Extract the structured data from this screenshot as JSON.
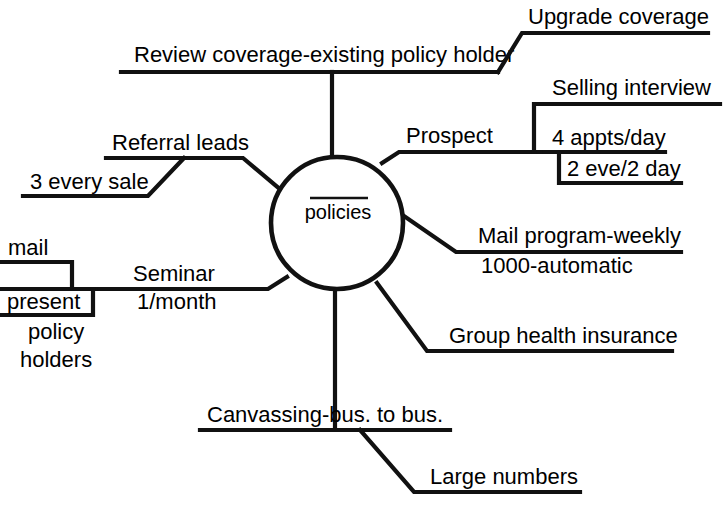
{
  "diagram": {
    "type": "mind-map",
    "title": "policies",
    "center": {
      "label": "policies",
      "shape": "circle",
      "cx": 337,
      "cy": 223,
      "r": 66
    },
    "colors": {
      "ink": "#111111",
      "background": "#ffffff",
      "text": "#000000"
    },
    "branches": [
      {
        "id": "review-coverage",
        "label": "Review coverage-existing policy holder",
        "direction": "top",
        "children": [
          {
            "id": "upgrade-coverage",
            "label": "Upgrade coverage"
          }
        ]
      },
      {
        "id": "prospect",
        "label": "Prospect",
        "direction": "top-right",
        "children": [
          {
            "id": "selling-interview",
            "label": "Selling interview"
          },
          {
            "id": "appts-per-day",
            "label": "4 appts/day"
          },
          {
            "id": "eve-day",
            "label": "2 eve/2 day"
          }
        ]
      },
      {
        "id": "mail-program",
        "label": "Mail program-weekly",
        "direction": "right",
        "children": [
          {
            "id": "automatic",
            "label": "1000-automatic"
          }
        ]
      },
      {
        "id": "group-health",
        "label": "Group health insurance",
        "direction": "bottom-right",
        "children": []
      },
      {
        "id": "canvassing",
        "label": "Canvassing-bus. to bus.",
        "direction": "bottom",
        "children": [
          {
            "id": "large-numbers",
            "label": "Large numbers"
          }
        ]
      },
      {
        "id": "seminar",
        "label": "Seminar",
        "direction": "left",
        "children": [
          {
            "id": "seminar-frequency",
            "label": "1/month"
          },
          {
            "id": "mail",
            "label": "mail"
          },
          {
            "id": "present",
            "label": "present"
          },
          {
            "id": "policy",
            "label": "policy"
          },
          {
            "id": "holders",
            "label": "holders"
          }
        ]
      },
      {
        "id": "referral-leads",
        "label": "Referral leads",
        "direction": "top-left",
        "children": [
          {
            "id": "three-every-sale",
            "label": "3 every sale"
          }
        ]
      }
    ]
  }
}
